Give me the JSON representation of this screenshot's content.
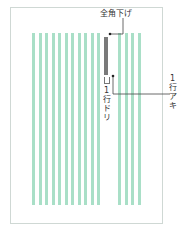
{
  "diagram": {
    "labels": {
      "indent": "全角下げ",
      "line_drop": "1行ドリ",
      "line_space": "1行アキ"
    },
    "line_drop_chars": [
      "1",
      "行",
      "ド",
      "リ"
    ],
    "line_space_chars": [
      "1",
      "行",
      "ア",
      "キ"
    ],
    "colors": {
      "stripe": "#a9dfc7",
      "bar": "#7a7a7a",
      "frame": "#cfd8d4",
      "leader": "#444444"
    },
    "stripes_left_count": 11,
    "stripes_right_count": 4
  }
}
